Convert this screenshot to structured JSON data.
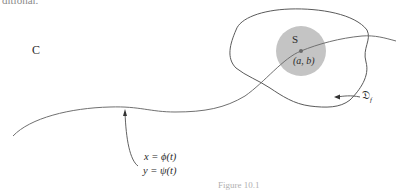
{
  "top_fragment": "ditional.",
  "labels": {
    "curve": "C",
    "region_s": "S",
    "point": "(a, b)",
    "domain": "𝔇",
    "domain_subscript": "f",
    "param_x": "x = ϕ(t)",
    "param_y": "y = ψ(t)"
  },
  "caption": "Figure 10.1",
  "colors": {
    "stroke": "#555555",
    "disk_fill": "#c4c4c4",
    "point": "#6b6b6b",
    "background": "#ffffff"
  }
}
